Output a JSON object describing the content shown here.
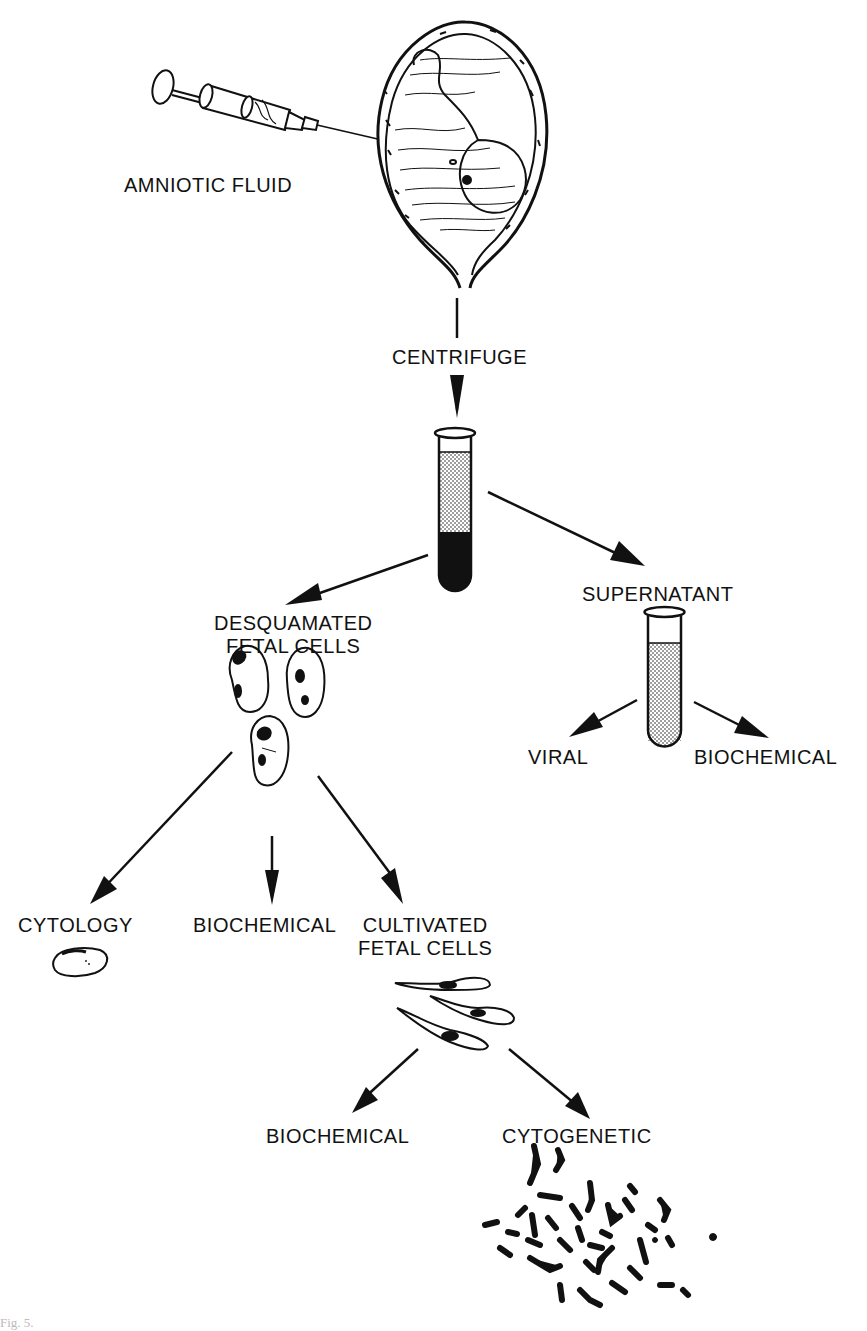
{
  "diagram": {
    "type": "flowchart",
    "nodes": {
      "amniotic_fluid": "AMNIOTIC FLUID",
      "centrifuge": "CENTRIFUGE",
      "desquamated_line1": "DESQUAMATED",
      "desquamated_line2": "FETAL CELLS",
      "supernatant": "SUPERNATANT",
      "viral": "VIRAL",
      "biochemical_supernatant": "BIOCHEMICAL",
      "cytology": "CYTOLOGY",
      "biochemical_cells": "BIOCHEMICAL",
      "cultivated_line1": "CULTIVATED",
      "cultivated_line2": "FETAL CELLS",
      "biochemical_cultured": "BIOCHEMICAL",
      "cytogenetic": "CYTOGENETIC"
    },
    "edges": [
      [
        "amniotic_fluid",
        "centrifuge"
      ],
      [
        "centrifuge",
        "centrifuged_tube"
      ],
      [
        "centrifuged_tube",
        "desquamated_fetal_cells"
      ],
      [
        "centrifuged_tube",
        "supernatant"
      ],
      [
        "supernatant",
        "viral"
      ],
      [
        "supernatant",
        "biochemical_supernatant"
      ],
      [
        "desquamated_fetal_cells",
        "cytology"
      ],
      [
        "desquamated_fetal_cells",
        "biochemical_cells"
      ],
      [
        "desquamated_fetal_cells",
        "cultivated_fetal_cells"
      ],
      [
        "cultivated_fetal_cells",
        "biochemical_cultured"
      ],
      [
        "cultivated_fetal_cells",
        "cytogenetic"
      ]
    ],
    "illustrations": [
      "syringe",
      "uterus-with-fetus",
      "test-tube-sediment",
      "test-tube-supernatant",
      "desquamated-cells",
      "cytology-cell",
      "fibroblast-cells",
      "chromosome-spread"
    ]
  },
  "caption": "Fig. 5."
}
